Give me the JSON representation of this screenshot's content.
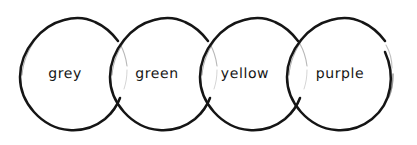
{
  "diagram": {
    "type": "overlapping-circles-chain",
    "style": "hand-drawn-ink-sketch",
    "background_color": "#ffffff",
    "stroke_color": "#151515",
    "text_color": "#151515",
    "canvas": {
      "width": 417,
      "height": 145
    },
    "circle_count": 4,
    "circles": [
      {
        "label": "grey",
        "name": "circle-grey",
        "cx": 76,
        "cy": 74,
        "r": 56,
        "label_x": 65,
        "label_y": 74
      },
      {
        "label": "green",
        "name": "circle-green",
        "cx": 166,
        "cy": 74,
        "r": 56,
        "label_x": 157,
        "label_y": 74
      },
      {
        "label": "yellow",
        "name": "circle-yellow",
        "cx": 256,
        "cy": 74,
        "r": 56,
        "label_x": 245,
        "label_y": 74
      },
      {
        "label": "purple",
        "name": "circle-purple",
        "cx": 343,
        "cy": 74,
        "r": 56,
        "label_x": 340,
        "label_y": 74
      }
    ]
  }
}
